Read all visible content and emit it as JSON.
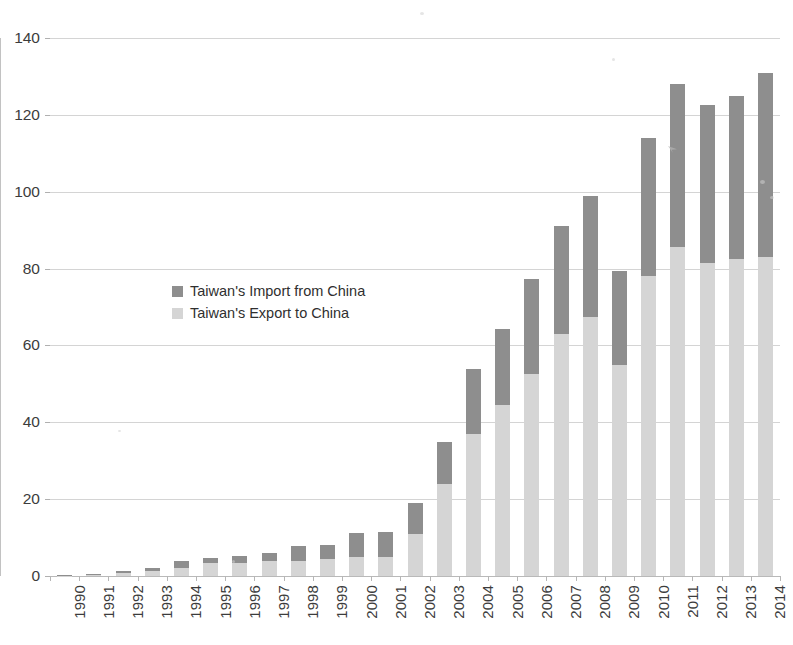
{
  "chart_data": {
    "type": "bar",
    "subtype": "stacked-vertical",
    "title": "",
    "xlabel": "",
    "ylabel": "",
    "ylim": [
      0,
      140
    ],
    "ytick_step": 20,
    "yticks": [
      0,
      20,
      40,
      60,
      80,
      100,
      120,
      140
    ],
    "grid": true,
    "legend_position": "inside-upper-left",
    "categories": [
      "1990",
      "1991",
      "1992",
      "1993",
      "1994",
      "1995",
      "1996",
      "1997",
      "1998",
      "1999",
      "2000",
      "2001",
      "2002",
      "2003",
      "2004",
      "2005",
      "2006",
      "2007",
      "2008",
      "2009",
      "2010",
      "2011",
      "2012",
      "2013",
      "2014"
    ],
    "series": [
      {
        "name": "Taiwan's Export to China",
        "color": "#d5d5d5",
        "values": [
          0.1,
          0.3,
          0.8,
          1.2,
          2.2,
          3.3,
          3.4,
          4.0,
          3.9,
          4.4,
          5.0,
          5.0,
          11.0,
          24.0,
          37.0,
          44.5,
          52.5,
          63.0,
          67.5,
          55.0,
          78.0,
          85.5,
          81.5,
          82.5,
          83.0
        ]
      },
      {
        "name": "Taiwan's Import from China",
        "color": "#8e8e8e",
        "values": [
          0.1,
          0.2,
          0.6,
          0.8,
          1.6,
          1.5,
          1.8,
          2.0,
          3.8,
          3.6,
          6.2,
          6.5,
          7.9,
          11.0,
          16.8,
          19.9,
          24.7,
          28.0,
          31.5,
          24.4,
          35.9,
          42.5,
          41.0,
          42.5,
          48.0
        ]
      }
    ],
    "totals": [
      0.2,
      0.5,
      1.4,
      2.0,
      3.8,
      4.8,
      5.2,
      6.0,
      7.7,
      8.0,
      11.2,
      11.5,
      18.9,
      35.0,
      53.8,
      64.4,
      77.2,
      91.0,
      99.0,
      79.4,
      113.9,
      128.0,
      122.5,
      125.0,
      131.0
    ]
  },
  "legend": {
    "items": [
      {
        "label": "Taiwan's Import from China",
        "swatch": "import"
      },
      {
        "label": "Taiwan's Export to China",
        "swatch": "export"
      }
    ]
  },
  "axes": {
    "y_labels": [
      "140",
      "120",
      "100",
      "80",
      "60",
      "40",
      "20",
      "0"
    ],
    "x_labels": [
      "1990",
      "1991",
      "1992",
      "1993",
      "1994",
      "1995",
      "1996",
      "1997",
      "1998",
      "1999",
      "2000",
      "2001",
      "2002",
      "2003",
      "2004",
      "2005",
      "2006",
      "2007",
      "2008",
      "2009",
      "2010",
      "2011",
      "2012",
      "2013",
      "2014"
    ]
  },
  "artifacts": {
    "top_text_remnant": "",
    "margin_mark": ""
  },
  "colors": {
    "import": "#8e8e8e",
    "export": "#d5d5d5",
    "grid": "#d4d4d4",
    "text": "#3c3c3c",
    "background": "#ffffff"
  }
}
